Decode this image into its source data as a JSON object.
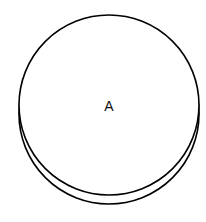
{
  "diagram": {
    "shape": "cylinder-disk",
    "node": {
      "label": "A",
      "stroke_color": "#000000",
      "fill_color": "#ffffff"
    }
  }
}
